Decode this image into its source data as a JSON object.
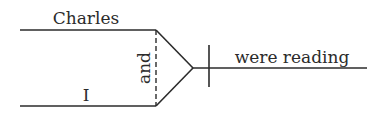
{
  "diagram": {
    "type": "sentence-diagram",
    "subjects": [
      {
        "word": "Charles",
        "position": "top-branch"
      },
      {
        "word": "I",
        "position": "bottom-branch"
      }
    ],
    "conjunction": {
      "word": "and",
      "orientation": "vertical-dashed"
    },
    "predicate": {
      "word": "were reading"
    }
  }
}
